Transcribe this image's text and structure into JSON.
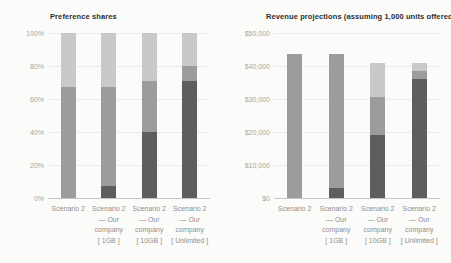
{
  "chart_data": [
    {
      "type": "bar",
      "stacked": true,
      "title": "Preference shares",
      "legend": "none",
      "grid": "horizontal",
      "xlabel": "",
      "ylabel": "",
      "ymax": 100,
      "ylim": [
        0,
        100
      ],
      "yticks": [
        {
          "value": 0,
          "label": "0%"
        },
        {
          "value": 20,
          "label": "20%"
        },
        {
          "value": 40,
          "label": "40%"
        },
        {
          "value": 60,
          "label": "60%"
        },
        {
          "value": 80,
          "label": "80%"
        },
        {
          "value": 100,
          "label": "100%"
        }
      ],
      "categories": [
        "Scenario 2",
        "Scenario 2\n— Our\ncompany\n[ 1GB ]",
        "Scenario 2\n— Our\ncompany\n[ 10GB ]",
        "Scenario 2\n— Our\ncompany\n[ Unlimited ]"
      ],
      "series": [
        {
          "name": "series-dark",
          "color": "#5e5e5e",
          "values": [
            0,
            7,
            40,
            71
          ]
        },
        {
          "name": "series-medium",
          "color": "#9c9c9a",
          "values": [
            67,
            60,
            31,
            9
          ]
        },
        {
          "name": "series-light",
          "color": "#c9c9c7",
          "values": [
            33,
            33,
            29,
            20
          ]
        }
      ]
    },
    {
      "type": "bar",
      "stacked": true,
      "title": "Revenue projections (assuming 1,000 units offered)",
      "legend": "none",
      "grid": "horizontal",
      "xlabel": "",
      "ylabel": "",
      "ymax": 50000,
      "ylim": [
        0,
        50000
      ],
      "yticks": [
        {
          "value": 0,
          "label": "$0"
        },
        {
          "value": 10000,
          "label": "$10,000"
        },
        {
          "value": 20000,
          "label": "$20,000"
        },
        {
          "value": 30000,
          "label": "$30,000"
        },
        {
          "value": 40000,
          "label": "$40,000"
        },
        {
          "value": 50000,
          "label": "$50,000"
        }
      ],
      "categories": [
        "Scenario 2",
        "Scenario 2\n— Our\ncompany\n[ 1GB ]",
        "Scenario 2\n— Our\ncompany\n[ 10GB ]",
        "Scenario 2\n— Our\ncompany\n[ Unlimited ]"
      ],
      "series": [
        {
          "name": "series-dark",
          "color": "#5e5e5e",
          "values": [
            0,
            3000,
            19000,
            36000
          ]
        },
        {
          "name": "series-medium",
          "color": "#9c9c9a",
          "values": [
            43500,
            40500,
            11500,
            2500
          ]
        },
        {
          "name": "series-light",
          "color": "#c9c9c7",
          "values": [
            0,
            0,
            10500,
            2500
          ]
        }
      ]
    }
  ]
}
